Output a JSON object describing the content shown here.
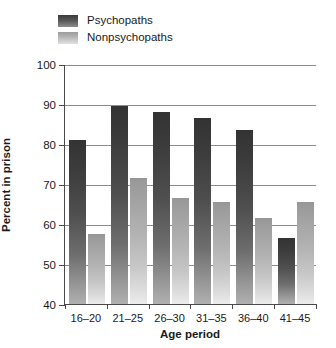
{
  "chart_data": {
    "type": "bar",
    "title": "",
    "xlabel": "Age period",
    "ylabel": "Percent in prison",
    "categories": [
      "16–20",
      "21–25",
      "26–30",
      "31–35",
      "36–40",
      "41–45"
    ],
    "series": [
      {
        "name": "Psychopaths",
        "color": "#3f3f3f",
        "values": [
          81,
          89.5,
          88,
          86.5,
          83.5,
          56.5
        ]
      },
      {
        "name": "Nonpsychopaths",
        "color": "#bdbdbd",
        "values": [
          57.5,
          71.5,
          66.5,
          65.5,
          61.5,
          65.5
        ]
      }
    ],
    "ylim": [
      40,
      100
    ],
    "yticks": [
      40,
      50,
      60,
      70,
      80,
      90,
      100
    ],
    "ytick_labels": [
      "40",
      "50",
      "60",
      "70",
      "80",
      "90",
      "100"
    ],
    "grid": true,
    "legend_position": "top-left"
  }
}
